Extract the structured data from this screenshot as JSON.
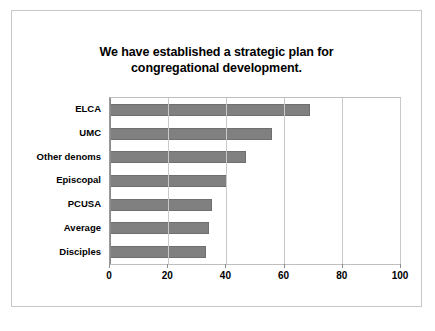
{
  "chart_data": {
    "type": "bar",
    "orientation": "horizontal",
    "title": "We have established a strategic plan for congregational development.",
    "title_line1": "We have established a strategic plan for",
    "title_line2": "congregational development.",
    "categories": [
      "ELCA",
      "UMC",
      "Other denoms",
      "Episcopal",
      "PCUSA",
      "Average",
      "Disciples"
    ],
    "values": [
      69,
      56,
      47,
      40.5,
      35,
      34,
      33
    ],
    "xlabel": "",
    "ylabel": "",
    "xlim": [
      0,
      100
    ],
    "xticks": [
      0,
      20,
      40,
      60,
      80,
      100
    ],
    "xtick_labels": [
      "0",
      "20",
      "40",
      "60",
      "80",
      "100"
    ],
    "grid": true,
    "legend": false,
    "bar_color": "#808080",
    "plot_background": "#FFFFFF",
    "frame_color": "#C8C8C8"
  }
}
